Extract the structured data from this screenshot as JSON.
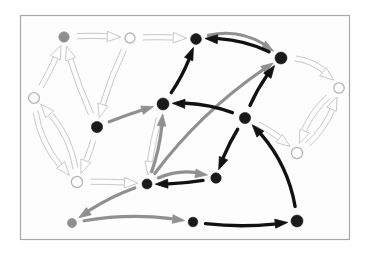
{
  "figure": {
    "background_color": "#ffffff",
    "frame": {
      "x": 20.5,
      "y": 15.5,
      "width": 329,
      "height": 224,
      "stroke": "#a8a8a8",
      "stroke_width": 1.2,
      "fill": "#fdfdfd"
    }
  },
  "legend_styles": {
    "node_black": "#1a1a1a",
    "node_gray": "#8f8f8f",
    "node_hollow_fill": "#ffffff",
    "node_hollow_stroke": "#b4b4b4",
    "edge_black": "#111111",
    "edge_gray": "#909090",
    "edge_outline_stroke": "#c9c9c9",
    "edge_outline_fill": "#ffffff"
  },
  "chart_data": {
    "type": "diagram",
    "xlim": [
      0,
      369
    ],
    "ylim": [
      0,
      254
    ],
    "node_count": 16,
    "edge_count": 30,
    "nodes": [
      {
        "id": "n1",
        "x": 64,
        "y": 37,
        "r": 5.2,
        "style": "gray",
        "label": ""
      },
      {
        "id": "n2",
        "x": 130,
        "y": 38,
        "r": 5.0,
        "style": "hollow",
        "label": ""
      },
      {
        "id": "n3",
        "x": 196,
        "y": 39,
        "r": 5.4,
        "style": "black",
        "label": ""
      },
      {
        "id": "n4",
        "x": 281,
        "y": 58,
        "r": 6.0,
        "style": "black",
        "label": ""
      },
      {
        "id": "n5",
        "x": 34,
        "y": 98,
        "r": 5.4,
        "style": "hollow",
        "label": ""
      },
      {
        "id": "n6",
        "x": 97,
        "y": 127,
        "r": 5.6,
        "style": "black",
        "label": ""
      },
      {
        "id": "n7",
        "x": 163,
        "y": 104,
        "r": 6.0,
        "style": "black",
        "label": ""
      },
      {
        "id": "n8",
        "x": 245,
        "y": 118,
        "r": 5.6,
        "style": "black",
        "label": ""
      },
      {
        "id": "n9",
        "x": 339,
        "y": 88,
        "r": 5.2,
        "style": "hollow",
        "label": ""
      },
      {
        "id": "n10",
        "x": 297,
        "y": 153,
        "r": 5.6,
        "style": "hollow",
        "label": ""
      },
      {
        "id": "n11",
        "x": 77,
        "y": 182,
        "r": 5.6,
        "style": "hollow",
        "label": ""
      },
      {
        "id": "n12",
        "x": 147,
        "y": 184,
        "r": 5.0,
        "style": "black",
        "label": ""
      },
      {
        "id": "n13",
        "x": 216,
        "y": 178,
        "r": 5.2,
        "style": "black",
        "label": ""
      },
      {
        "id": "n14",
        "x": 72,
        "y": 223,
        "r": 4.6,
        "style": "gray",
        "label": ""
      },
      {
        "id": "n15",
        "x": 193,
        "y": 222,
        "r": 4.8,
        "style": "black",
        "label": ""
      },
      {
        "id": "n16",
        "x": 297,
        "y": 221,
        "r": 6.0,
        "style": "black",
        "label": ""
      }
    ],
    "edges": [
      {
        "from": "n1",
        "to": "n2",
        "kind": "outline",
        "curve": -0.05
      },
      {
        "from": "n2",
        "to": "n3",
        "kind": "outline",
        "curve": -0.04
      },
      {
        "from": "n5",
        "to": "n1",
        "kind": "outline",
        "curve": 0.06
      },
      {
        "from": "n6",
        "to": "n1",
        "kind": "outline",
        "curve": -0.05
      },
      {
        "from": "n2",
        "to": "n6",
        "kind": "outline",
        "curve": 0.07
      },
      {
        "from": "n11",
        "to": "n5",
        "kind": "outline",
        "curve": 0.22
      },
      {
        "from": "n5",
        "to": "n11",
        "kind": "outline",
        "curve": 0.22
      },
      {
        "from": "n6",
        "to": "n11",
        "kind": "outline",
        "curve": -0.05
      },
      {
        "from": "n11",
        "to": "n12",
        "kind": "outline",
        "curve": -0.03
      },
      {
        "from": "n7",
        "to": "n12",
        "kind": "outline",
        "curve": 0.05
      },
      {
        "from": "n4",
        "to": "n9",
        "kind": "outline",
        "curve": -0.3
      },
      {
        "from": "n9",
        "to": "n10",
        "kind": "outline",
        "curve": 0.2
      },
      {
        "from": "n10",
        "to": "n9",
        "kind": "outline",
        "curve": 0.2
      },
      {
        "from": "n8",
        "to": "n10",
        "kind": "outline",
        "curve": -0.1
      },
      {
        "from": "n3",
        "to": "n4",
        "kind": "gray",
        "curve": -0.32
      },
      {
        "from": "n6",
        "to": "n7",
        "kind": "gray",
        "curve": -0.04
      },
      {
        "from": "n12",
        "to": "n7",
        "kind": "gray",
        "curve": 0.1
      },
      {
        "from": "n12",
        "to": "n4",
        "kind": "gray",
        "curve": -0.1
      },
      {
        "from": "n12",
        "to": "n13",
        "kind": "gray",
        "curve": -0.26
      },
      {
        "from": "n12",
        "to": "n14",
        "kind": "gray",
        "curve": 0.1
      },
      {
        "from": "n14",
        "to": "n15",
        "kind": "gray",
        "curve": -0.1
      },
      {
        "from": "n7",
        "to": "n3",
        "kind": "black",
        "curve": 0.1
      },
      {
        "from": "n4",
        "to": "n3",
        "kind": "black",
        "curve": 0.16
      },
      {
        "from": "n8",
        "to": "n4",
        "kind": "black",
        "curve": -0.1
      },
      {
        "from": "n8",
        "to": "n7",
        "kind": "black",
        "curve": 0.14
      },
      {
        "from": "n8",
        "to": "n13",
        "kind": "black",
        "curve": 0.08
      },
      {
        "from": "n13",
        "to": "n12",
        "kind": "black",
        "curve": -0.06
      },
      {
        "from": "n16",
        "to": "n8",
        "kind": "black",
        "curve": 0.2
      },
      {
        "from": "n15",
        "to": "n16",
        "kind": "black",
        "curve": 0.08
      }
    ]
  }
}
